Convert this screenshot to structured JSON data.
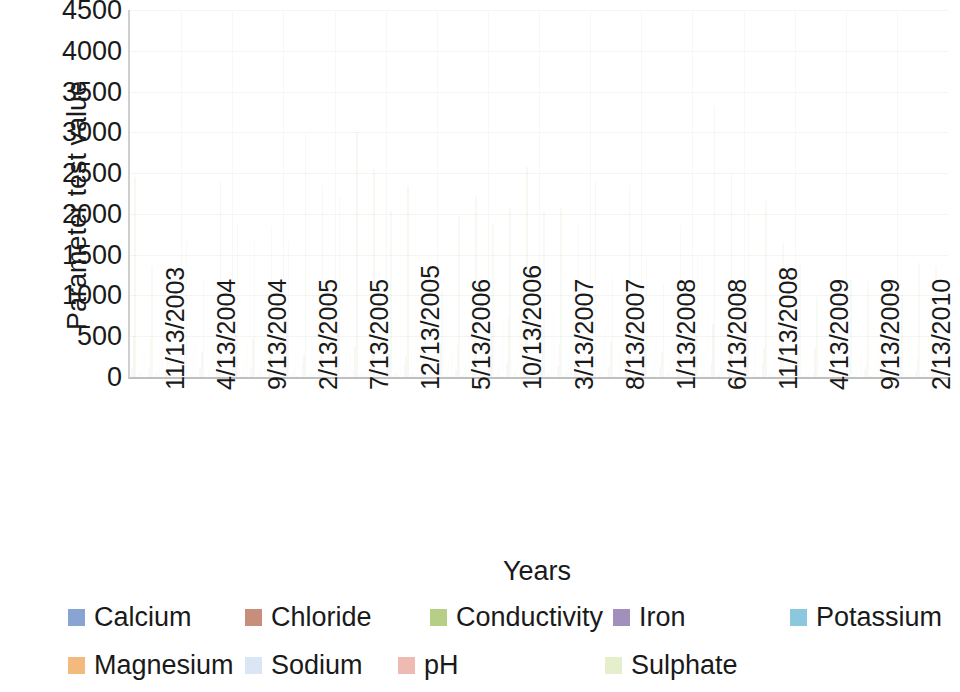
{
  "chart_data": {
    "type": "bar",
    "title": "",
    "subtitle": "",
    "xlabel": "Years",
    "ylabel": "Parameter test value",
    "ylim": [
      0,
      4500
    ],
    "ytick_step": 500,
    "yticks": [
      "4500",
      "4000",
      "3500",
      "3000",
      "2500",
      "2000",
      "1500",
      "1000",
      "500",
      "0"
    ],
    "grid": true,
    "grid_orientation": "horizontal",
    "legend_position": "bottom",
    "stacking": "none",
    "bar_style": "clustered-columns-very-faded",
    "categories": [
      "11/13/2003",
      "4/13/2004",
      "9/13/2004",
      "2/13/2005",
      "7/13/2005",
      "12/13/2005",
      "5/13/2006",
      "10/13/2006",
      "3/13/2007",
      "8/13/2007",
      "1/13/2008",
      "6/13/2008",
      "11/13/2008",
      "4/13/2009",
      "9/13/2009",
      "2/13/2010"
    ],
    "xtick_labels": [
      "11/13/2003",
      "4/13/2004",
      "9/13/2004",
      "2/13/2005",
      "7/13/2005",
      "12/13/2005",
      "5/13/2006",
      "10/13/2006",
      "3/13/2007",
      "8/13/2007",
      "1/13/2008",
      "6/13/2008",
      "11/13/2008",
      "4/13/2009",
      "9/13/2009",
      "2/13/2010"
    ],
    "series": [
      {
        "name": "Calcium",
        "color": "#5b7fc0",
        "values": [
          120,
          95,
          140,
          110,
          130,
          105,
          150,
          125,
          118,
          100,
          135,
          160,
          90,
          80,
          95,
          110
        ]
      },
      {
        "name": "Chloride",
        "color": "#b3634a",
        "values": [
          420,
          380,
          510,
          470,
          360,
          330,
          560,
          490,
          410,
          350,
          470,
          640,
          300,
          260,
          310,
          380
        ]
      },
      {
        "name": "Conductivity",
        "color": "#9bbb59",
        "values": [
          1950,
          1600,
          2150,
          2900,
          1800,
          1550,
          2600,
          2050,
          1900,
          1700,
          2000,
          3150,
          1250,
          900,
          1150,
          1400
        ]
      },
      {
        "name": "Iron",
        "color": "#8064a2",
        "values": [
          3,
          2,
          5,
          4,
          3,
          2,
          6,
          4,
          3,
          2,
          4,
          7,
          2,
          1,
          2,
          3
        ]
      },
      {
        "name": "Potassium",
        "color": "#5fb3d0",
        "values": [
          22,
          18,
          26,
          24,
          20,
          16,
          28,
          25,
          21,
          17,
          24,
          32,
          14,
          12,
          15,
          18
        ]
      },
      {
        "name": "Magnesium",
        "color": "#f0a04b",
        "values": [
          60,
          52,
          72,
          66,
          55,
          48,
          78,
          68,
          58,
          50,
          65,
          88,
          42,
          36,
          44,
          54
        ]
      },
      {
        "name": "Sodium",
        "color": "#ccddf0",
        "values": [
          310,
          270,
          390,
          350,
          280,
          240,
          430,
          360,
          300,
          255,
          345,
          470,
          210,
          185,
          225,
          280
        ]
      },
      {
        "name": "pH",
        "color": "#e8a093",
        "values": [
          7.4,
          7.2,
          7.5,
          7.3,
          7.4,
          7.1,
          7.6,
          7.4,
          7.3,
          7.2,
          7.5,
          7.7,
          7.2,
          7.0,
          7.2,
          7.3
        ]
      },
      {
        "name": "Sulphate",
        "color": "#dce9b8",
        "values": [
          520,
          450,
          610,
          580,
          470,
          410,
          700,
          600,
          510,
          430,
          590,
          820,
          360,
          310,
          380,
          460
        ]
      }
    ]
  },
  "axis": {
    "y_title": "Parameter test value",
    "x_title": "Years"
  },
  "legend": {
    "rows": [
      [
        {
          "label": "Calcium",
          "color": "#5b7fc0",
          "x": 8
        },
        {
          "label": "Chloride",
          "color": "#b3634a",
          "x": 185
        },
        {
          "label": "Conductivity",
          "color": "#9bbb59",
          "x": 370
        },
        {
          "label": "Iron",
          "color": "#8064a2",
          "x": 553
        },
        {
          "label": "Potassium",
          "color": "#5fb3d0",
          "x": 730
        }
      ],
      [
        {
          "label": "Magnesium",
          "color": "#f0a04b",
          "x": 8
        },
        {
          "label": "Sodium",
          "color": "#ccddf0",
          "x": 185
        },
        {
          "label": "pH",
          "color": "#e8a093",
          "x": 338
        },
        {
          "label": "Sulphate",
          "color": "#dce9b8",
          "x": 545
        }
      ]
    ]
  }
}
